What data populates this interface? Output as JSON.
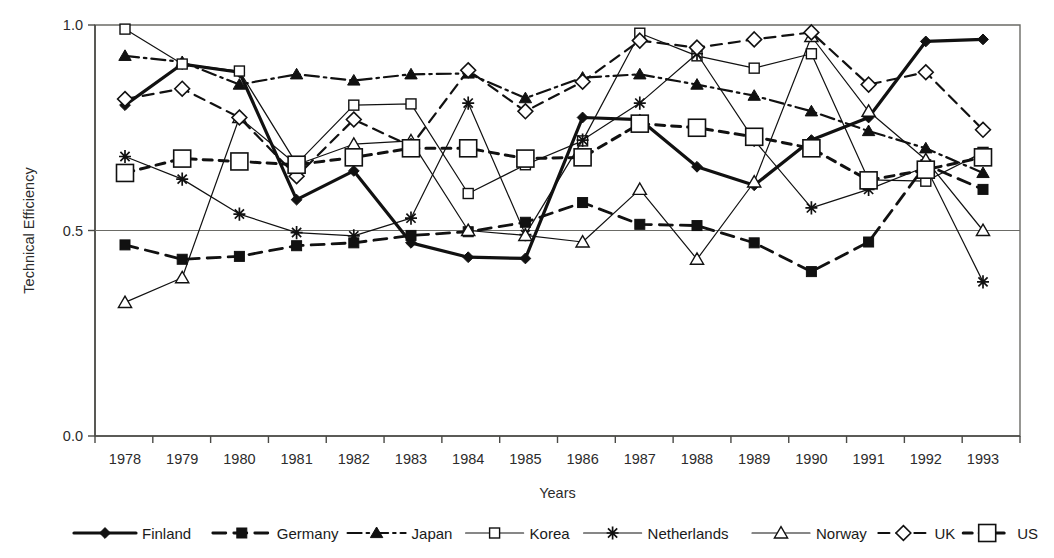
{
  "chart_data": {
    "type": "line",
    "title": "",
    "xlabel": "Years",
    "ylabel": "Technical Efficiency",
    "grid": false,
    "legend_position": "bottom",
    "ylim": [
      0.0,
      1.0
    ],
    "yticks": [
      "0.0",
      "0.5",
      "1.0"
    ],
    "ytick_values": [
      0.0,
      0.5,
      1.0
    ],
    "categories": [
      "1978",
      "1979",
      "1980",
      "1981",
      "1982",
      "1983",
      "1984",
      "1985",
      "1986",
      "1987",
      "1988",
      "1989",
      "1990",
      "1991",
      "1992",
      "1993"
    ],
    "series": [
      {
        "name": "Finland",
        "marker": "filled-diamond",
        "line": "solid-thick",
        "values": [
          0.805,
          0.905,
          0.885,
          0.575,
          0.645,
          0.47,
          0.435,
          0.432,
          0.775,
          0.77,
          0.655,
          0.61,
          0.72,
          0.775,
          0.96,
          0.965
        ]
      },
      {
        "name": "Germany",
        "marker": "filled-square",
        "line": "dashed-thick",
        "values": [
          0.465,
          0.43,
          0.437,
          0.463,
          0.47,
          0.488,
          0.497,
          0.52,
          0.568,
          0.515,
          0.512,
          0.47,
          0.4,
          0.472,
          0.66,
          0.6
        ]
      },
      {
        "name": "Japan",
        "marker": "filled-triangle",
        "line": "dash-dot",
        "values": [
          0.925,
          0.91,
          0.855,
          0.88,
          0.865,
          0.88,
          0.882,
          0.822,
          0.872,
          0.88,
          0.855,
          0.828,
          0.79,
          0.742,
          0.7,
          0.64
        ]
      },
      {
        "name": "Korea",
        "marker": "open-square-small",
        "line": "solid-thin",
        "values": [
          0.99,
          0.905,
          0.888,
          0.662,
          0.805,
          0.808,
          0.59,
          0.66,
          0.718,
          0.98,
          0.925,
          0.895,
          0.93,
          0.623,
          0.62,
          0.69
        ]
      },
      {
        "name": "Netherlands",
        "marker": "star",
        "line": "solid-thin",
        "values": [
          0.68,
          0.625,
          0.54,
          0.495,
          0.487,
          0.53,
          0.81,
          0.49,
          0.72,
          0.81,
          0.93,
          0.72,
          0.555,
          0.6,
          0.655,
          0.375
        ]
      },
      {
        "name": "Norway",
        "marker": "open-triangle",
        "line": "solid-thin",
        "values": [
          0.325,
          0.385,
          0.775,
          0.66,
          0.71,
          0.718,
          0.5,
          0.488,
          0.472,
          0.6,
          0.43,
          0.618,
          0.972,
          0.79,
          0.672,
          0.5
        ]
      },
      {
        "name": "UK",
        "marker": "open-diamond",
        "line": "dashed-thin",
        "values": [
          0.82,
          0.845,
          0.775,
          0.632,
          0.77,
          0.705,
          0.89,
          0.79,
          0.862,
          0.962,
          0.945,
          0.965,
          0.982,
          0.855,
          0.885,
          0.745
        ]
      },
      {
        "name": "US",
        "marker": "open-square-large",
        "line": "dotted-thick",
        "values": [
          0.64,
          0.675,
          0.668,
          0.66,
          0.678,
          0.7,
          0.7,
          0.675,
          0.678,
          0.76,
          0.75,
          0.728,
          0.7,
          0.622,
          0.648,
          0.678
        ]
      }
    ]
  },
  "legend": {
    "items": [
      {
        "label": "Finland"
      },
      {
        "label": "Germany"
      },
      {
        "label": "Japan"
      },
      {
        "label": "Korea"
      },
      {
        "label": "Netherlands"
      },
      {
        "label": "Norway"
      },
      {
        "label": "UK"
      },
      {
        "label": "US"
      }
    ]
  }
}
